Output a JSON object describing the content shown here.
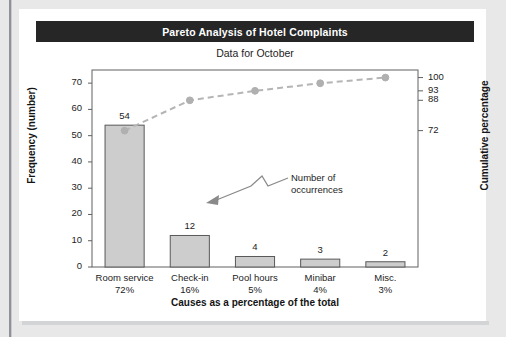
{
  "header": {
    "title": "Pareto Analysis of Hotel Complaints",
    "subtitle": "Data for October"
  },
  "annotation": {
    "line1": "Number of",
    "line2": "occurrences"
  },
  "colors": {
    "title_band": "#262626",
    "title_text": "#ffffff",
    "bar_fill": "#cdcdcd",
    "bar_stroke": "#595959",
    "line": "#b5b5b5",
    "marker": "#b0b0b0",
    "axis": "#606060",
    "text": "#1d1d1d",
    "page_background": "#e8e8e8",
    "card_background": "#ffffff"
  },
  "chart_data": {
    "type": "bar",
    "title": "Pareto Analysis of Hotel Complaints",
    "subtitle": "Data for October",
    "xlabel": "Causes as a percentage of the total",
    "ylabel": "Frequency (number)",
    "y2label": "Cumulative percentage",
    "categories": [
      "Room service",
      "Check-in",
      "Pool hours",
      "Minibar",
      "Misc."
    ],
    "category_percents": [
      "72%",
      "16%",
      "5%",
      "4%",
      "3%"
    ],
    "values": [
      54,
      12,
      4,
      3,
      2
    ],
    "value_labels": [
      "54",
      "12",
      "4",
      "3",
      "2"
    ],
    "cumulative": [
      72,
      88,
      93,
      97,
      100
    ],
    "ylim": [
      0,
      75
    ],
    "yticks": [
      0,
      10,
      20,
      30,
      40,
      50,
      60,
      70
    ],
    "ytick_labels": [
      "0",
      "10",
      "20",
      "30",
      "40",
      "50",
      "60",
      "70"
    ],
    "y2lim": [
      0,
      104
    ],
    "y2ticks": [
      72,
      88,
      93,
      100
    ],
    "y2tick_labels": [
      "72",
      "88",
      "93",
      "100"
    ],
    "grid": false,
    "legend": "none",
    "series": [
      {
        "name": "Frequency (number)",
        "type": "bar",
        "values": [
          54,
          12,
          4,
          3,
          2
        ]
      },
      {
        "name": "Cumulative percentage",
        "type": "line",
        "values": [
          72,
          88,
          93,
          97,
          100
        ],
        "style": "dashed",
        "marker": "circle"
      }
    ]
  }
}
